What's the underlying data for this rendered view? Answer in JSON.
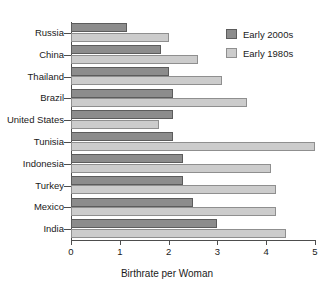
{
  "chart_data": {
    "type": "bar",
    "orientation": "horizontal",
    "title": "",
    "xlabel": "Birthrate per Woman",
    "ylabel": "",
    "xlim": [
      0,
      5
    ],
    "xticks": [
      "0",
      "1",
      "2",
      "3",
      "4",
      "5"
    ],
    "grid": false,
    "legend_position": "top-right",
    "categories": [
      "Russia",
      "China",
      "Thailand",
      "Brazil",
      "United States",
      "Tunisia",
      "Indonesia",
      "Turkey",
      "Mexico",
      "India"
    ],
    "series": [
      {
        "name": "Early 2000s",
        "color": "#8c8c8c",
        "values": [
          1.15,
          1.85,
          2.0,
          2.1,
          2.1,
          2.1,
          2.3,
          2.3,
          2.5,
          3.0
        ]
      },
      {
        "name": "Early 1980s",
        "color": "#cccccc",
        "values": [
          2.0,
          2.6,
          3.1,
          3.6,
          1.8,
          5.0,
          4.1,
          4.2,
          4.2,
          4.4
        ]
      }
    ]
  },
  "legend": {
    "items": [
      {
        "label": "Early 2000s",
        "swatch": "dark"
      },
      {
        "label": "Early 1980s",
        "swatch": "light"
      }
    ]
  },
  "axis": {
    "x_title": "Birthrate per Woman"
  }
}
